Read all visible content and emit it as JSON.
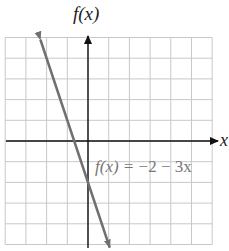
{
  "chart_data": {
    "type": "line",
    "title": "",
    "xlabel": "x",
    "ylabel": "f(x)",
    "xlim": [
      -4,
      6
    ],
    "ylim": [
      -5,
      5
    ],
    "grid": true,
    "grid_step": 1,
    "tick_labels": false,
    "series": [
      {
        "name": "f(x) = −2 − 3x",
        "equation": "f(x) = -2 - 3x",
        "slope": -3,
        "intercept": -2,
        "x": [
          -2.3,
          1.05
        ],
        "y": [
          4.9,
          -5.15
        ],
        "color": "#707070",
        "arrows": "both"
      }
    ],
    "annotations": [
      {
        "text": "f(x) = −2 − 3x",
        "x": 0.35,
        "y": -1.3
      }
    ]
  },
  "labels": {
    "y_axis": "f(x)",
    "x_axis": "x",
    "equation_prefix": "f(x) = ",
    "equation_body": "−2 − 3x"
  },
  "colors": {
    "grid": "#c8c8c8",
    "axis": "#111111",
    "line": "#707070",
    "equation_text": "#777777"
  }
}
